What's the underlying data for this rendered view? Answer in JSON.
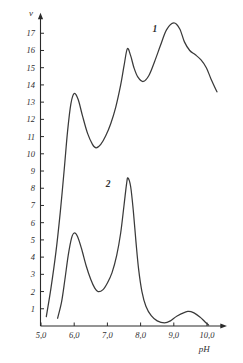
{
  "chart_data": {
    "type": "line",
    "title": "",
    "subtitle": "",
    "xlabel": "pH",
    "ylabel": "v",
    "xlim": [
      4.7,
      10.45
    ],
    "ylim": [
      0,
      17.9
    ],
    "grid": false,
    "legend_position": "inline-annotations",
    "x_ticks": [
      {
        "value": 5.0,
        "label": "5,0"
      },
      {
        "value": 6.0,
        "label": "6,0"
      },
      {
        "value": 7.0,
        "label": "7,0"
      },
      {
        "value": 8.0,
        "label": "8,0"
      },
      {
        "value": 9.0,
        "label": "9,0"
      },
      {
        "value": 10.0,
        "label": "10,0"
      }
    ],
    "y_ticks": [
      {
        "value": 1,
        "label": "1"
      },
      {
        "value": 2,
        "label": "2"
      },
      {
        "value": 3,
        "label": "3"
      },
      {
        "value": 4,
        "label": "4"
      },
      {
        "value": 5,
        "label": "5"
      },
      {
        "value": 6,
        "label": "6"
      },
      {
        "value": 7,
        "label": "7"
      },
      {
        "value": 8,
        "label": "8"
      },
      {
        "value": 9,
        "label": "9"
      },
      {
        "value": 10,
        "label": "10"
      },
      {
        "value": 11,
        "label": "11"
      },
      {
        "value": 12,
        "label": "12"
      },
      {
        "value": 13,
        "label": "13"
      },
      {
        "value": 14,
        "label": "14"
      },
      {
        "value": 15,
        "label": "15"
      },
      {
        "value": 16,
        "label": "16"
      },
      {
        "value": 17,
        "label": "17"
      }
    ],
    "annotations": [
      {
        "text": "1",
        "x": 8.43,
        "y": 17.1,
        "for_series": "1"
      },
      {
        "text": "2",
        "x": 7.02,
        "y": 8.05,
        "for_series": "2"
      }
    ],
    "series": [
      {
        "name": "1",
        "label": "1",
        "color": "#3a3a3a",
        "peaks": [
          {
            "x": 6.0,
            "y": 13.5
          },
          {
            "x": 7.6,
            "y": 16.1
          },
          {
            "x": 9.0,
            "y": 17.6
          }
        ],
        "minima": [
          {
            "x": 6.66,
            "y": 10.35
          },
          {
            "x": 8.08,
            "y": 14.2
          }
        ],
        "points": [
          {
            "x": 5.16,
            "y": 0.55
          },
          {
            "x": 5.3,
            "y": 2.2
          },
          {
            "x": 5.45,
            "y": 4.3
          },
          {
            "x": 5.58,
            "y": 6.6
          },
          {
            "x": 5.7,
            "y": 9.1
          },
          {
            "x": 5.8,
            "y": 11.3
          },
          {
            "x": 5.9,
            "y": 12.9
          },
          {
            "x": 6.0,
            "y": 13.5
          },
          {
            "x": 6.12,
            "y": 13.15
          },
          {
            "x": 6.25,
            "y": 12.2
          },
          {
            "x": 6.4,
            "y": 11.2
          },
          {
            "x": 6.55,
            "y": 10.55
          },
          {
            "x": 6.66,
            "y": 10.35
          },
          {
            "x": 6.8,
            "y": 10.55
          },
          {
            "x": 6.95,
            "y": 11.05
          },
          {
            "x": 7.1,
            "y": 11.75
          },
          {
            "x": 7.25,
            "y": 12.7
          },
          {
            "x": 7.4,
            "y": 14.0
          },
          {
            "x": 7.5,
            "y": 15.1
          },
          {
            "x": 7.6,
            "y": 16.1
          },
          {
            "x": 7.7,
            "y": 15.7
          },
          {
            "x": 7.8,
            "y": 15.0
          },
          {
            "x": 7.92,
            "y": 14.45
          },
          {
            "x": 8.08,
            "y": 14.2
          },
          {
            "x": 8.25,
            "y": 14.55
          },
          {
            "x": 8.42,
            "y": 15.35
          },
          {
            "x": 8.6,
            "y": 16.3
          },
          {
            "x": 8.78,
            "y": 17.2
          },
          {
            "x": 9.0,
            "y": 17.6
          },
          {
            "x": 9.18,
            "y": 17.25
          },
          {
            "x": 9.32,
            "y": 16.5
          },
          {
            "x": 9.48,
            "y": 16.0
          },
          {
            "x": 9.65,
            "y": 15.75
          },
          {
            "x": 9.82,
            "y": 15.45
          },
          {
            "x": 9.98,
            "y": 15.0
          },
          {
            "x": 10.12,
            "y": 14.35
          },
          {
            "x": 10.3,
            "y": 13.6
          }
        ]
      },
      {
        "name": "2",
        "label": "2",
        "color": "#3a3a3a",
        "peaks": [
          {
            "x": 6.0,
            "y": 5.4
          },
          {
            "x": 7.6,
            "y": 8.6
          },
          {
            "x": 9.42,
            "y": 0.85
          }
        ],
        "minima": [
          {
            "x": 6.72,
            "y": 2.0
          },
          {
            "x": 8.72,
            "y": 0.18
          }
        ],
        "points": [
          {
            "x": 5.5,
            "y": 0.45
          },
          {
            "x": 5.62,
            "y": 1.4
          },
          {
            "x": 5.72,
            "y": 2.7
          },
          {
            "x": 5.82,
            "y": 4.1
          },
          {
            "x": 5.92,
            "y": 5.1
          },
          {
            "x": 6.0,
            "y": 5.4
          },
          {
            "x": 6.1,
            "y": 5.2
          },
          {
            "x": 6.22,
            "y": 4.5
          },
          {
            "x": 6.36,
            "y": 3.5
          },
          {
            "x": 6.5,
            "y": 2.7
          },
          {
            "x": 6.62,
            "y": 2.2
          },
          {
            "x": 6.72,
            "y": 2.0
          },
          {
            "x": 6.86,
            "y": 2.1
          },
          {
            "x": 7.0,
            "y": 2.5
          },
          {
            "x": 7.14,
            "y": 3.1
          },
          {
            "x": 7.28,
            "y": 4.1
          },
          {
            "x": 7.4,
            "y": 5.4
          },
          {
            "x": 7.5,
            "y": 7.0
          },
          {
            "x": 7.58,
            "y": 8.3
          },
          {
            "x": 7.62,
            "y": 8.6
          },
          {
            "x": 7.7,
            "y": 8.1
          },
          {
            "x": 7.78,
            "y": 6.7
          },
          {
            "x": 7.86,
            "y": 4.9
          },
          {
            "x": 7.94,
            "y": 3.3
          },
          {
            "x": 8.04,
            "y": 2.0
          },
          {
            "x": 8.16,
            "y": 1.15
          },
          {
            "x": 8.32,
            "y": 0.6
          },
          {
            "x": 8.5,
            "y": 0.3
          },
          {
            "x": 8.72,
            "y": 0.18
          },
          {
            "x": 8.9,
            "y": 0.3
          },
          {
            "x": 9.1,
            "y": 0.58
          },
          {
            "x": 9.42,
            "y": 0.85
          },
          {
            "x": 9.62,
            "y": 0.75
          },
          {
            "x": 9.8,
            "y": 0.5
          },
          {
            "x": 9.95,
            "y": 0.22
          },
          {
            "x": 10.05,
            "y": 0.05
          }
        ]
      }
    ]
  },
  "axes": {
    "y_axis_title": "v",
    "x_axis_title": "pH"
  }
}
